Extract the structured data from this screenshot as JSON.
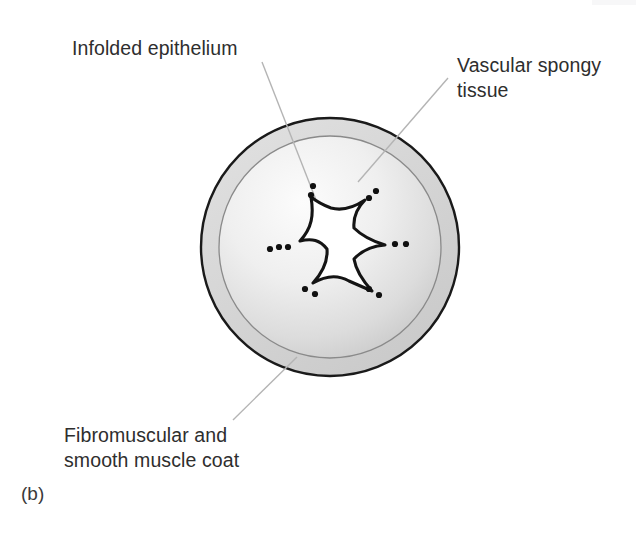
{
  "figure": {
    "panel_label": "(b)",
    "background_color": "#ffffff",
    "width": 640,
    "height": 557
  },
  "labels": {
    "infolded_epithelium": "Infolded epithelium",
    "vascular_spongy_tissue": "Vascular spongy\ntissue",
    "fibromuscular_coat": "Fibromuscular and\nsmooth muscle coat"
  },
  "colors": {
    "text": "#2e2e2e",
    "outline": "#1a1a1a",
    "outer_ring_fill": "#d8d8d8",
    "inner_fill_light": "#fbfbfb",
    "inner_fill_dark": "#cfcfcf",
    "lumen_fill": "#ffffff",
    "leader_line": "#b4b4b4",
    "dot": "#111111"
  },
  "diagram": {
    "name": "urethra-cross-section",
    "center_x": 330,
    "center_y": 247,
    "outer_radius": 130,
    "ring_inner_radius": 112,
    "lumen_points": 6,
    "dot_clusters": [
      {
        "position": "top",
        "count": 2
      },
      {
        "position": "upper-right",
        "count": 2
      },
      {
        "position": "right",
        "count": 2
      },
      {
        "position": "lower-right",
        "count": 2
      },
      {
        "position": "lower-left",
        "count": 2
      },
      {
        "position": "left",
        "count": 3
      }
    ]
  },
  "leader_lines": [
    {
      "name": "leader-infolded-epithelium",
      "x1": 262,
      "y1": 62,
      "x2": 318,
      "y2": 205
    },
    {
      "name": "leader-vascular-spongy-tissue",
      "x1": 448,
      "y1": 78,
      "x2": 358,
      "y2": 182
    },
    {
      "name": "leader-fibromuscular-coat",
      "x1": 233,
      "y1": 420,
      "x2": 297,
      "y2": 357
    }
  ]
}
